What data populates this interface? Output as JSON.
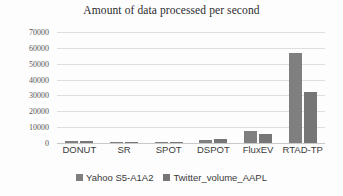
{
  "chart_data": {
    "type": "bar",
    "title": "Amount of data processed per second",
    "xlabel": "",
    "ylabel": "",
    "categories": [
      "DONUT",
      "SR",
      "SPOT",
      "DSPOT",
      "FluxEV",
      "RTAD-TP"
    ],
    "series": [
      {
        "name": "Yahoo S5-A1A2",
        "color": "#7f7f7f",
        "values": [
          1300,
          700,
          400,
          2200,
          7500,
          57000
        ]
      },
      {
        "name": "Twitter_volume_AAPL",
        "color": "#767676",
        "values": [
          1300,
          700,
          400,
          2300,
          6000,
          32000
        ]
      }
    ],
    "ylim": [
      0,
      70000
    ],
    "yticks": [
      0,
      10000,
      20000,
      30000,
      40000,
      50000,
      60000,
      70000
    ],
    "ytick_labels": [
      "0",
      "10000",
      "20000",
      "30000",
      "40000",
      "50000",
      "60000",
      "70000"
    ],
    "grid": true,
    "legend_position": "bottom"
  }
}
